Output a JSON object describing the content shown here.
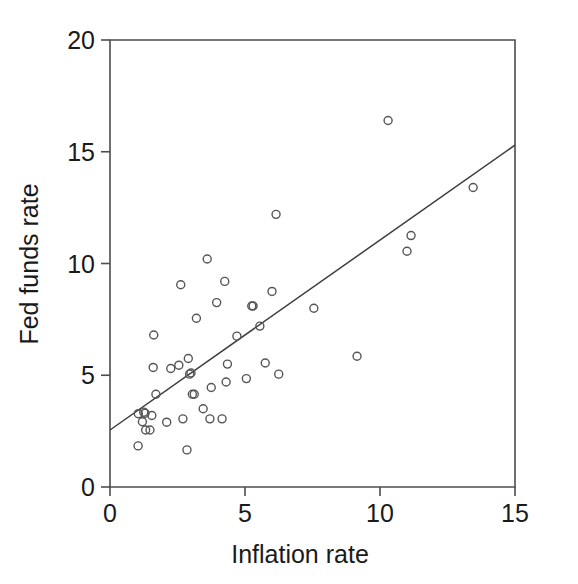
{
  "chart_data": {
    "type": "scatter",
    "title": "",
    "xlabel": "Inflation rate",
    "ylabel": "Fed funds rate",
    "xlim": [
      0,
      15
    ],
    "ylim": [
      0,
      20
    ],
    "xticks": [
      0,
      5,
      10,
      15
    ],
    "yticks": [
      0,
      5,
      10,
      15,
      20
    ],
    "xtick_labels": [
      "0",
      "5",
      "10",
      "15"
    ],
    "ytick_labels": [
      "0",
      "5",
      "10",
      "15",
      "20"
    ],
    "grid": false,
    "legend": null,
    "marker_style": "open-circle",
    "points": [
      {
        "x": 1.04,
        "y": 1.84
      },
      {
        "x": 1.05,
        "y": 3.28
      },
      {
        "x": 1.2,
        "y": 2.92
      },
      {
        "x": 1.25,
        "y": 3.35
      },
      {
        "x": 1.3,
        "y": 3.3
      },
      {
        "x": 1.32,
        "y": 2.55
      },
      {
        "x": 1.48,
        "y": 2.55
      },
      {
        "x": 1.55,
        "y": 3.2
      },
      {
        "x": 1.6,
        "y": 5.35
      },
      {
        "x": 1.62,
        "y": 6.8
      },
      {
        "x": 1.7,
        "y": 4.15
      },
      {
        "x": 2.1,
        "y": 2.9
      },
      {
        "x": 2.25,
        "y": 5.3
      },
      {
        "x": 2.55,
        "y": 5.45
      },
      {
        "x": 2.62,
        "y": 9.05
      },
      {
        "x": 2.7,
        "y": 3.05
      },
      {
        "x": 2.85,
        "y": 1.66
      },
      {
        "x": 2.9,
        "y": 5.75
      },
      {
        "x": 2.95,
        "y": 5.05
      },
      {
        "x": 3.0,
        "y": 5.1
      },
      {
        "x": 3.05,
        "y": 4.15
      },
      {
        "x": 3.12,
        "y": 4.15
      },
      {
        "x": 3.2,
        "y": 7.55
      },
      {
        "x": 3.45,
        "y": 3.5
      },
      {
        "x": 3.6,
        "y": 10.2
      },
      {
        "x": 3.7,
        "y": 3.05
      },
      {
        "x": 3.75,
        "y": 4.45
      },
      {
        "x": 3.95,
        "y": 8.25
      },
      {
        "x": 4.15,
        "y": 3.05
      },
      {
        "x": 4.25,
        "y": 9.2
      },
      {
        "x": 4.3,
        "y": 4.7
      },
      {
        "x": 4.35,
        "y": 5.5
      },
      {
        "x": 4.7,
        "y": 6.75
      },
      {
        "x": 5.05,
        "y": 4.85
      },
      {
        "x": 5.25,
        "y": 8.1
      },
      {
        "x": 5.3,
        "y": 8.1
      },
      {
        "x": 5.55,
        "y": 7.2
      },
      {
        "x": 5.75,
        "y": 5.55
      },
      {
        "x": 6.0,
        "y": 8.75
      },
      {
        "x": 6.15,
        "y": 12.2
      },
      {
        "x": 6.25,
        "y": 5.05
      },
      {
        "x": 7.55,
        "y": 8.0
      },
      {
        "x": 9.15,
        "y": 5.85
      },
      {
        "x": 10.3,
        "y": 16.4
      },
      {
        "x": 11.0,
        "y": 10.55
      },
      {
        "x": 11.15,
        "y": 11.25
      },
      {
        "x": 13.45,
        "y": 13.4
      }
    ],
    "fit_line": {
      "type": "linear-regression",
      "x_start": 0.0,
      "y_start": 2.55,
      "x_end": 15.0,
      "y_end": 15.3
    }
  },
  "axes": {
    "x_title": "Inflation rate",
    "y_title": "Fed funds rate"
  }
}
